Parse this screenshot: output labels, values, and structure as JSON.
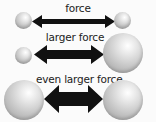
{
  "rows": [
    {
      "label": "force",
      "left_sphere": "small",
      "right_sphere": "small",
      "arrow_size": "thin"
    },
    {
      "label": "larger force",
      "left_sphere": "small",
      "right_sphere": "large",
      "arrow_size": "medium"
    },
    {
      "label": "even larger force",
      "left_sphere": "large",
      "right_sphere": "large",
      "arrow_size": "thick"
    }
  ],
  "colors": {
    "arrow": "#111111",
    "sphere": "#bdbdbd",
    "background": "#fbfbfb"
  }
}
